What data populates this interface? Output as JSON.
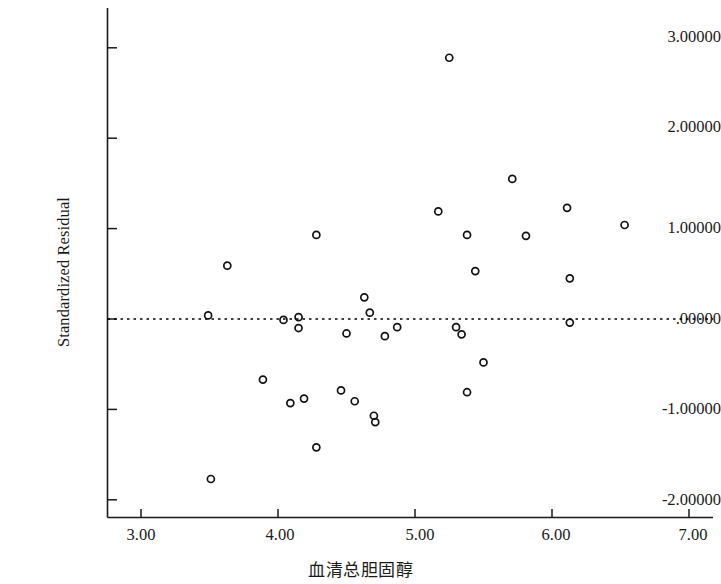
{
  "chart_data": {
    "type": "scatter",
    "title": "",
    "xlabel": "血清总胆固醇",
    "ylabel": "Standardized Residual",
    "xlim": [
      2.7,
      7.15
    ],
    "ylim": [
      -2.32,
      3.22
    ],
    "xticks": [
      3.0,
      4.0,
      5.0,
      6.0,
      7.0
    ],
    "xtick_labels": [
      "3.00",
      "4.00",
      "5.00",
      "6.00",
      "7.00"
    ],
    "yticks": [
      3.0,
      2.0,
      1.0,
      0.0,
      -1.0,
      -2.0
    ],
    "ytick_labels": [
      "3.00000",
      "2.00000",
      "1.00000",
      ".00000",
      "-1.00000",
      "-2.00000"
    ],
    "grid": false,
    "legend": null,
    "reference_line": {
      "orientation": "horizontal",
      "value": 0.0,
      "style": "dotted",
      "color": "#000000"
    },
    "marker": {
      "shape": "open-circle",
      "size": 7,
      "edge_color": "#111111",
      "fill": "none"
    },
    "series": [
      {
        "name": "Standardized Residual",
        "points": [
          [
            3.49,
            0.04
          ],
          [
            3.51,
            -1.77
          ],
          [
            3.63,
            0.59
          ],
          [
            3.89,
            -0.67
          ],
          [
            4.04,
            -0.01
          ],
          [
            4.09,
            -0.93
          ],
          [
            4.15,
            0.02
          ],
          [
            4.15,
            -0.1
          ],
          [
            4.19,
            -0.88
          ],
          [
            4.28,
            0.93
          ],
          [
            4.28,
            -1.42
          ],
          [
            4.46,
            -0.79
          ],
          [
            4.5,
            -0.16
          ],
          [
            4.56,
            -0.91
          ],
          [
            4.63,
            0.24
          ],
          [
            4.67,
            0.07
          ],
          [
            4.7,
            -1.07
          ],
          [
            4.71,
            -1.14
          ],
          [
            4.78,
            -0.19
          ],
          [
            4.87,
            -0.09
          ],
          [
            5.17,
            1.19
          ],
          [
            5.25,
            2.89
          ],
          [
            5.3,
            -0.09
          ],
          [
            5.34,
            -0.17
          ],
          [
            5.38,
            0.93
          ],
          [
            5.44,
            0.53
          ],
          [
            5.5,
            -0.48
          ],
          [
            5.38,
            -0.81
          ],
          [
            5.71,
            1.55
          ],
          [
            5.81,
            0.92
          ],
          [
            6.11,
            1.23
          ],
          [
            6.13,
            0.45
          ],
          [
            6.13,
            -0.04
          ],
          [
            6.53,
            1.04
          ]
        ]
      }
    ]
  },
  "axes": {
    "y_title": "Standardized Residual",
    "x_title": "血清总胆固醇"
  }
}
